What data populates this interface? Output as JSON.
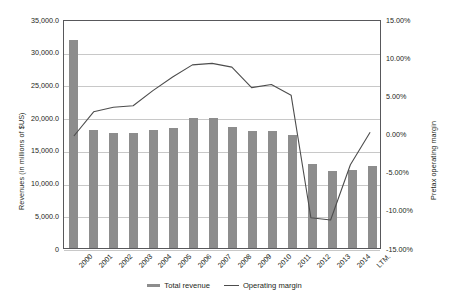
{
  "axes": {
    "left_title": "Revenues (in millions of $US)",
    "right_title": "Pretax operating margin",
    "left_ticks": [
      "35,000.0",
      "30,000.0",
      "25,000.0",
      "20,000.0",
      "15,000.0",
      "10,000.0",
      "5,000.0",
      "0"
    ],
    "right_ticks": [
      "15.00%",
      "10.00%",
      "5.00%",
      "0.00%",
      "-5.00%",
      "-10.00%",
      "-15.00%"
    ]
  },
  "legend": {
    "items": [
      {
        "label": "Total revenue",
        "marker": "bar-swatch",
        "color": "#8d8d8d"
      },
      {
        "label": "Operating margin",
        "marker": "line-swatch",
        "color": "#4d4d4d"
      }
    ]
  },
  "chart_data": {
    "type": "bar",
    "title": "",
    "subtitle": "",
    "xlabel": "",
    "ylabel": "Revenues (in millions of $US)",
    "y2label": "Pretax operating margin",
    "ylim": [
      0,
      35000
    ],
    "y2lim": [
      -15,
      15
    ],
    "grid": true,
    "legend_position": "bottom",
    "categories": [
      "2000",
      "2001",
      "2002",
      "2003",
      "2004",
      "2005",
      "2006",
      "2007",
      "2008",
      "2009",
      "2010",
      "2011",
      "2012",
      "2013",
      "2014",
      "LTM"
    ],
    "series": [
      {
        "name": "Total revenue",
        "axis": "left",
        "type": "bar",
        "color": "#8d8d8d",
        "unit": "millions of $US",
        "values": [
          31800,
          18000,
          17600,
          17600,
          18000,
          18400,
          19900,
          19900,
          18500,
          17900,
          17900,
          17200,
          12800,
          11800,
          12000,
          12500
        ]
      },
      {
        "name": "Operating margin",
        "axis": "right",
        "type": "line",
        "color": "#4d4d4d",
        "unit": "percent",
        "values": [
          -0.2,
          3.0,
          3.6,
          3.8,
          5.8,
          7.6,
          9.2,
          9.4,
          8.9,
          6.2,
          6.6,
          5.2,
          -11.0,
          -11.3,
          -4.0,
          0.3
        ]
      }
    ]
  }
}
